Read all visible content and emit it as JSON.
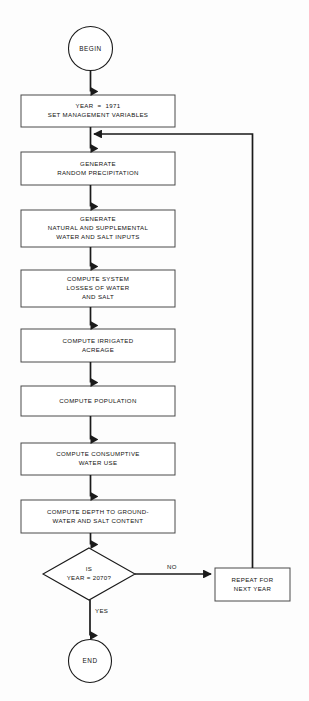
{
  "diagram": {
    "type": "flowchart",
    "background_color": "#fdfdfd",
    "line_color": "#1a1a1a",
    "text_color": "#111111"
  },
  "nodes": [
    {
      "id": "begin",
      "shape": "terminator-circle",
      "label": "BEGIN",
      "lines": [
        "BEGIN"
      ],
      "x": 68,
      "y": 26,
      "w": 45,
      "h": 45
    },
    {
      "id": "init",
      "shape": "process",
      "label": "YEAR = 1971 / SET MANAGEMENT VARIABLES",
      "lines": [
        "YEAR  =  1971",
        "SET MANAGEMENT VARIABLES"
      ],
      "x": 21,
      "y": 95,
      "w": 154,
      "h": 32
    },
    {
      "id": "precip",
      "shape": "process",
      "label": "GENERATE RANDOM PRECIPITATION",
      "lines": [
        "GENERATE",
        "RANDOM PRECIPITATION"
      ],
      "x": 21,
      "y": 152,
      "w": 154,
      "h": 33
    },
    {
      "id": "inputs",
      "shape": "process",
      "label": "GENERATE NATURAL AND SUPPLEMENTAL WATER AND SALT INPUTS",
      "lines": [
        "GENERATE",
        "NATURAL AND SUPPLEMENTAL",
        "WATER AND SALT INPUTS"
      ],
      "x": 21,
      "y": 210,
      "w": 154,
      "h": 37
    },
    {
      "id": "losses",
      "shape": "process",
      "label": "COMPUTE SYSTEM LOSSES OF WATER AND SALT",
      "lines": [
        "COMPUTE SYSTEM",
        "LOSSES OF WATER",
        "AND SALT"
      ],
      "x": 21,
      "y": 270,
      "w": 154,
      "h": 37
    },
    {
      "id": "acreage",
      "shape": "process",
      "label": "COMPUTE IRRIGATED ACREAGE",
      "lines": [
        "COMPUTE IRRIGATED",
        "ACREAGE"
      ],
      "x": 21,
      "y": 329,
      "w": 154,
      "h": 33
    },
    {
      "id": "population",
      "shape": "process",
      "label": "COMPUTE POPULATION",
      "lines": [
        "COMPUTE POPULATION"
      ],
      "x": 21,
      "y": 386,
      "w": 154,
      "h": 30
    },
    {
      "id": "consumptive",
      "shape": "process",
      "label": "COMPUTE CONSUMPTIVE WATER USE",
      "lines": [
        "COMPUTE CONSUMPTIVE",
        "WATER USE"
      ],
      "x": 21,
      "y": 443,
      "w": 154,
      "h": 32
    },
    {
      "id": "depth",
      "shape": "process",
      "label": "COMPUTE DEPTH TO GROUND-WATER AND SALT CONTENT",
      "lines": [
        "COMPUTE DEPTH TO GROUND-",
        "WATER AND SALT CONTENT"
      ],
      "x": 21,
      "y": 500,
      "w": 154,
      "h": 33
    },
    {
      "id": "decision",
      "shape": "decision-diamond",
      "label": "IS YEAR = 2070?",
      "lines": [
        "IS",
        "YEAR = 2070?"
      ],
      "x": 43,
      "y": 548,
      "w": 92,
      "h": 52
    },
    {
      "id": "repeat",
      "shape": "process",
      "label": "REPEAT FOR NEXT YEAR",
      "lines": [
        "REPEAT FOR",
        "NEXT YEAR"
      ],
      "x": 215,
      "y": 568,
      "w": 75,
      "h": 33
    },
    {
      "id": "end",
      "shape": "terminator-circle",
      "label": "END",
      "lines": [
        "END"
      ],
      "x": 68,
      "y": 639,
      "w": 44,
      "h": 44
    }
  ],
  "edge_labels": [
    {
      "id": "no-label",
      "text": "NO",
      "x": 167,
      "y": 566
    },
    {
      "id": "yes-label",
      "text": "YES",
      "x": 99,
      "y": 612
    }
  ],
  "edges": [
    {
      "id": "begin-to-init",
      "from": "begin",
      "to": "init",
      "label": ""
    },
    {
      "id": "init-to-precip",
      "from": "init",
      "to": "precip",
      "label": ""
    },
    {
      "id": "precip-to-inputs",
      "from": "precip",
      "to": "inputs",
      "label": ""
    },
    {
      "id": "inputs-to-losses",
      "from": "inputs",
      "to": "losses",
      "label": ""
    },
    {
      "id": "losses-to-acreage",
      "from": "losses",
      "to": "acreage",
      "label": ""
    },
    {
      "id": "acreage-to-population",
      "from": "acreage",
      "to": "population",
      "label": ""
    },
    {
      "id": "population-to-consumptive",
      "from": "population",
      "to": "consumptive",
      "label": ""
    },
    {
      "id": "consumptive-to-depth",
      "from": "consumptive",
      "to": "depth",
      "label": ""
    },
    {
      "id": "depth-to-decision",
      "from": "depth",
      "to": "decision",
      "label": ""
    },
    {
      "id": "decision-to-repeat",
      "from": "decision",
      "to": "repeat",
      "label": "NO"
    },
    {
      "id": "decision-to-end",
      "from": "decision",
      "to": "end",
      "label": "YES"
    },
    {
      "id": "repeat-to-precip-loop",
      "from": "repeat",
      "to": "precip",
      "label": ""
    }
  ]
}
